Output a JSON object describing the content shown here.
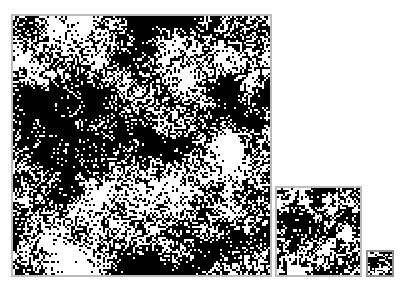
{
  "figure": {
    "kind": "nested-scale-binary-noise-fields",
    "width": 414,
    "height": 291,
    "background_color": "#ffffff",
    "panel_count": 3,
    "caption": "",
    "title": "",
    "labels": []
  },
  "chart_data": {
    "type": "heatmap",
    "title": "",
    "subtitle": "",
    "xlabel": "",
    "ylabel": "",
    "grid": false,
    "legend": null,
    "annotations": [],
    "colormap": [
      "#ffffff",
      "#000000"
    ],
    "value_levels": [
      0,
      1
    ],
    "series": [
      {
        "name": "fine-scale-field",
        "panel": "large",
        "grid_cells_x": 128,
        "grid_cells_y": 128,
        "cell_px": 2.02,
        "black_fraction": 0.58,
        "cluster_scale_px": 11,
        "seed": 20250117
      },
      {
        "name": "medium-scale-field",
        "panel": "medium",
        "grid_cells_x": 42,
        "grid_cells_y": 42,
        "cell_px": 2.05,
        "black_fraction": 0.58,
        "cluster_scale_px": 4.2,
        "seed": 20250117
      },
      {
        "name": "coarse-scale-field",
        "panel": "small",
        "grid_cells_x": 13,
        "grid_cells_y": 13,
        "cell_px": 2.0,
        "black_fraction": 0.58,
        "cluster_scale_px": 1.6,
        "seed": 20250117
      }
    ]
  },
  "panels": [
    {
      "id": "large",
      "name": "Large field panel",
      "x": 11,
      "y": 14,
      "width": 261,
      "height": 263,
      "border_width": 2,
      "border_color": "#bcbcbc",
      "fill_color": "#ffffff",
      "ink_color": "#000000"
    },
    {
      "id": "medium",
      "name": "Medium field panel",
      "x": 275,
      "y": 186,
      "width": 87,
      "height": 91,
      "border_width": 2,
      "border_color": "#bcbcbc",
      "fill_color": "#ffffff",
      "ink_color": "#000000"
    },
    {
      "id": "small",
      "name": "Small field panel",
      "x": 366,
      "y": 250,
      "width": 28,
      "height": 27,
      "border_width": 2,
      "border_color": "#8f8f8f",
      "fill_color": "#ffffff",
      "ink_color": "#000000"
    }
  ]
}
